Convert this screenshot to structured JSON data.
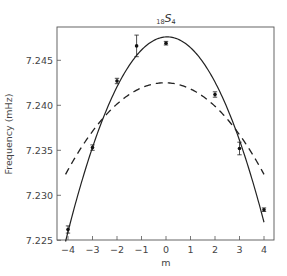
{
  "chart_data": {
    "type": "scatter",
    "title": "18S4",
    "title_parts": {
      "pre_subscript": "18",
      "main": "S",
      "post_subscript": "4"
    },
    "xlabel": "m",
    "ylabel": "Frequency (mHz)",
    "xlim": [
      -4.45,
      4.4
    ],
    "ylim": [
      7.225,
      7.2487
    ],
    "xticks": [
      -4,
      -3,
      -2,
      -1,
      0,
      1,
      2,
      3,
      4
    ],
    "xtick_labels": [
      "−4",
      "−3",
      "−2",
      "−1",
      "0",
      "1",
      "2",
      "3",
      "4"
    ],
    "yticks": [
      7.225,
      7.23,
      7.235,
      7.24,
      7.245
    ],
    "ytick_labels": [
      "7.225",
      "7.230",
      "7.235",
      "7.240",
      "7.245"
    ],
    "grid": false,
    "legend": null,
    "series": [
      {
        "name": "observed",
        "style": "points-with-errorbars",
        "color": "#222222",
        "x": [
          -4,
          -3,
          -2,
          -1.2,
          0,
          2,
          3,
          4
        ],
        "y": [
          7.2262,
          7.2353,
          7.2427,
          7.2466,
          7.2469,
          7.2412,
          7.2352,
          7.2284
        ],
        "yerr": [
          0.0004,
          0.0003,
          0.0003,
          0.0012,
          0.0002,
          0.0003,
          0.0007,
          0.0002
        ]
      },
      {
        "name": "fit-solid",
        "style": "solid-line",
        "color": "#222222",
        "center": 0.05,
        "peak": 7.2476,
        "curvature": -0.00132,
        "x_range": [
          -4.1,
          4.0
        ]
      },
      {
        "name": "model-dashed",
        "style": "dashed-line",
        "color": "#222222",
        "center": -0.05,
        "peak": 7.2425,
        "curvature": -0.00062,
        "x_range": [
          -4.1,
          4.0
        ]
      }
    ]
  }
}
